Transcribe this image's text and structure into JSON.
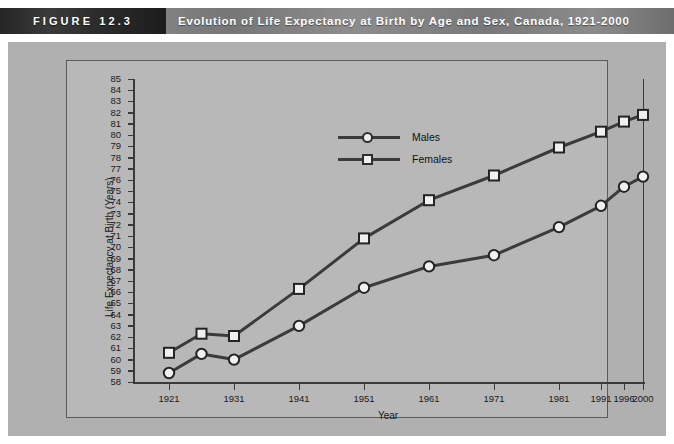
{
  "header": {
    "figure_tag": "FIGURE 12.3",
    "title": "Evolution of Life Expectancy at Birth by Age and Sex, Canada, 1921-2000"
  },
  "chart_data": {
    "type": "line",
    "title": "Evolution of Life Expectancy at Birth by Age and Sex, Canada, 1921-2000",
    "xlabel": "Year",
    "ylabel": "Life Expectancy at Birth (Years)",
    "categories": [
      "1921",
      "1926",
      "1931",
      "1941",
      "1951",
      "1961",
      "1971",
      "1981",
      "1991",
      "1996",
      "2000"
    ],
    "tick_labels_x": [
      "1921",
      "1931",
      "1941",
      "1951",
      "1961",
      "1971",
      "1981",
      "1991",
      "1996",
      "2000"
    ],
    "tick_labels_y": [
      "85",
      "84",
      "83",
      "82",
      "81",
      "80",
      "79",
      "78",
      "77",
      "76",
      "75",
      "74",
      "73",
      "72",
      "71",
      "70",
      "69",
      "68",
      "67",
      "66",
      "65",
      "64",
      "63",
      "62",
      "61",
      "60",
      "59",
      "58"
    ],
    "ylim": [
      58,
      85
    ],
    "ytick_step": 1,
    "grid": false,
    "legend_position": "top-center",
    "series": [
      {
        "name": "Males",
        "marker": "circle",
        "color": "#3b3b3b",
        "values": [
          58.8,
          60.5,
          60.0,
          63.0,
          66.4,
          68.3,
          69.3,
          71.8,
          73.7,
          75.4,
          76.3
        ]
      },
      {
        "name": "Females",
        "marker": "square",
        "color": "#3b3b3b",
        "values": [
          60.6,
          62.3,
          62.1,
          66.3,
          70.8,
          74.2,
          76.4,
          78.9,
          80.3,
          81.2,
          81.8
        ]
      }
    ]
  }
}
